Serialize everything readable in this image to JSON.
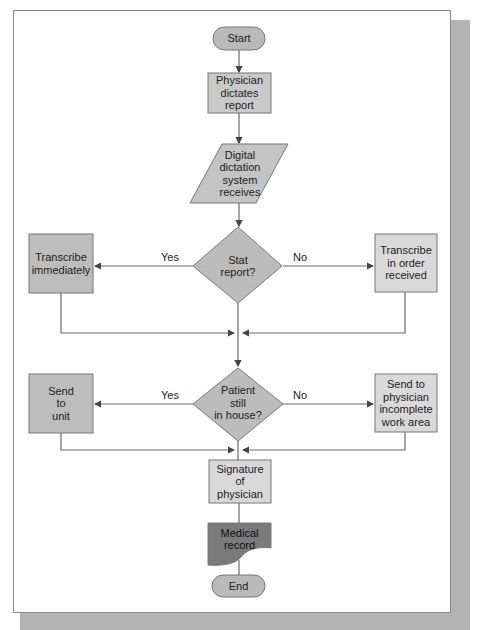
{
  "colors": {
    "terminal_fill": "#b9b9b9",
    "process_dark_fill": "#bdbdbd",
    "process_light_fill": "#d9d9d9",
    "decision_fill": "#bcbcbc",
    "io_fill": "#c4c4c4",
    "document_fill": "#7a7a7a",
    "line": "#6a6a6a",
    "shadow": "#b4b4b4"
  },
  "nodes": {
    "start": "Start",
    "physician_dictates": "Physician\ndictates\nreport",
    "digital_dictation": "Digital\ndictation\nsystem\nreceives",
    "stat_report": "Stat\nreport?",
    "transcribe_immediately": "Transcribe\nimmediately",
    "transcribe_in_order": "Transcribe\nin order\nreceived",
    "patient_in_house": "Patient\nstill\nin house?",
    "send_to_unit": "Send\nto\nunit",
    "send_to_physician": "Send to\nphysician\nincomplete\nwork area",
    "signature": "Signature\nof\nphysician",
    "medical_record": "Medical\nrecord",
    "end": "End"
  },
  "edges": {
    "stat_yes": "Yes",
    "stat_no": "No",
    "inhouse_yes": "Yes",
    "inhouse_no": "No"
  }
}
